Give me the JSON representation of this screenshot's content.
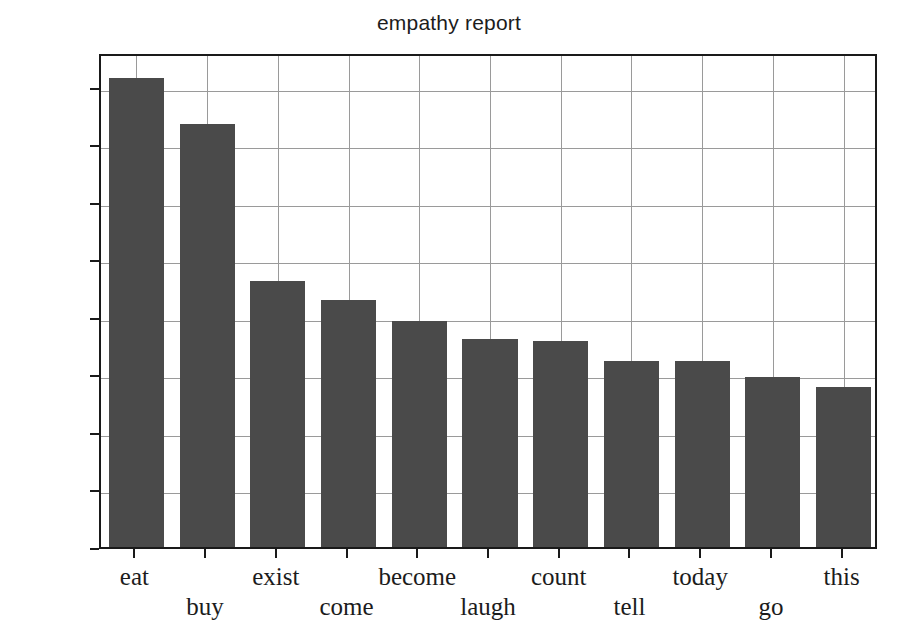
{
  "chart_data": {
    "type": "bar",
    "title": "empathy report",
    "xlabel": "",
    "ylabel": "",
    "categories": [
      "eat",
      "buy",
      "exist",
      "come",
      "become",
      "laugh",
      "count",
      "tell",
      "today",
      "go",
      "this"
    ],
    "values": [
      1630,
      1470,
      925,
      860,
      785,
      723,
      715,
      647,
      645,
      590,
      555
    ],
    "ylim": [
      0,
      1720
    ],
    "yticks": [
      0,
      200,
      400,
      600,
      800,
      1000,
      1200,
      1400,
      1600
    ],
    "ytick_labels": [
      "0",
      "200",
      "400",
      "600",
      "800",
      "1000",
      "1200",
      "1400",
      "1600"
    ],
    "grid": true,
    "legend": null,
    "bar_color": "#4a4a4a",
    "grid_color": "#9a9a9a",
    "axis_color": "#1a1a1a",
    "background_color": "#ffffff",
    "xtick_label_alternating_rows": true
  }
}
